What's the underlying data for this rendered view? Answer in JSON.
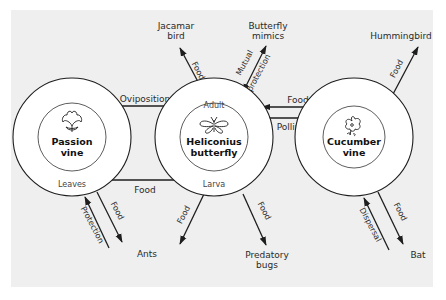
{
  "colors": {
    "panel_bg": "#efefef",
    "page_bg": "#ffffff",
    "stroke": "#1e1e1e",
    "text": "#2a2a2a"
  },
  "nodes": {
    "passion_vine": {
      "title_line1": "Passion",
      "title_line2": "vine",
      "sublabel_bottom": "Leaves",
      "icon": "leaf-icon"
    },
    "heliconius": {
      "title_line1": "Heliconius",
      "title_line2": "butterfly",
      "sublabel_top": "Adult",
      "sublabel_bottom": "Larva",
      "icon": "butterfly-icon"
    },
    "cucumber_vine": {
      "title_line1": "Cucumber",
      "title_line2": "vine",
      "icon": "flower-icon"
    }
  },
  "external": {
    "jacamar_line1": "Jacamar",
    "jacamar_line2": "bird",
    "mimics_line1": "Butterfly",
    "mimics_line2": "mimics",
    "hummingbird": "Hummingbird",
    "ants": "Ants",
    "predatory_line1": "Predatory",
    "predatory_line2": "bugs",
    "bat": "Bat"
  },
  "edges": {
    "oviposition": "Oviposition",
    "leaves_food": "Food",
    "adult_food_from_cucumber": "Food",
    "pollination": "Pollination",
    "jacamar_food": "Food",
    "mutual_line1": "Mutual",
    "mutual_line2": "protection",
    "hummingbird_food": "Food",
    "ants_food_from_vine": "Food",
    "ants_protection": "Protection",
    "larva_food_ants": "Food",
    "larva_food_bugs": "Food",
    "bat_food": "Food",
    "bat_dispersal": "Dispersal"
  }
}
